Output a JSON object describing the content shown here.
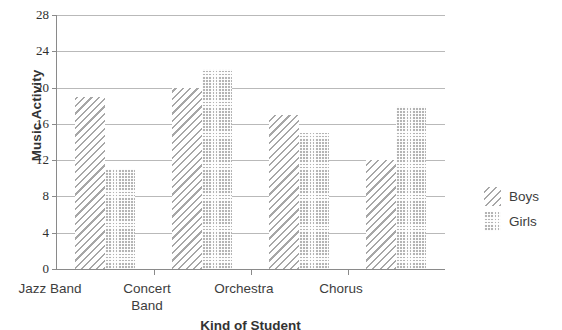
{
  "chart_data": {
    "type": "bar",
    "title": "",
    "xlabel": "Kind of Student",
    "ylabel": "Music Activity",
    "categories": [
      "Jazz Band",
      "Concert Band",
      "Orchestra",
      "Chorus"
    ],
    "category_lines": [
      [
        "Jazz Band"
      ],
      [
        "Concert",
        "Band"
      ],
      [
        "Orchestra"
      ],
      [
        "Chorus"
      ]
    ],
    "series": [
      {
        "name": "Boys",
        "values": [
          19,
          20,
          17,
          12
        ],
        "pattern": "diagonal-hatch",
        "color": "#a7a7a7"
      },
      {
        "name": "Girls",
        "values": [
          11,
          22,
          15,
          18
        ],
        "pattern": "dotted-grid",
        "color": "#b4b4b4"
      }
    ],
    "ylim": [
      0,
      28
    ],
    "yticks": [
      0,
      4,
      8,
      12,
      16,
      20,
      24,
      28
    ],
    "ytick_labels": [
      "0",
      "4",
      "8",
      "12",
      "16",
      "20",
      "24",
      "28"
    ],
    "grid": true,
    "grid_axis": "y",
    "legend_position": "right"
  },
  "legend": {
    "entries": [
      {
        "label": "Boys"
      },
      {
        "label": "Girls"
      }
    ]
  },
  "colors": {
    "axis": "#8a8a8a",
    "grid": "#b9b9b9",
    "text": "#3d3d3d",
    "boys": "#a7a7a7",
    "girls": "#b4b4b4",
    "background": "#ffffff"
  }
}
